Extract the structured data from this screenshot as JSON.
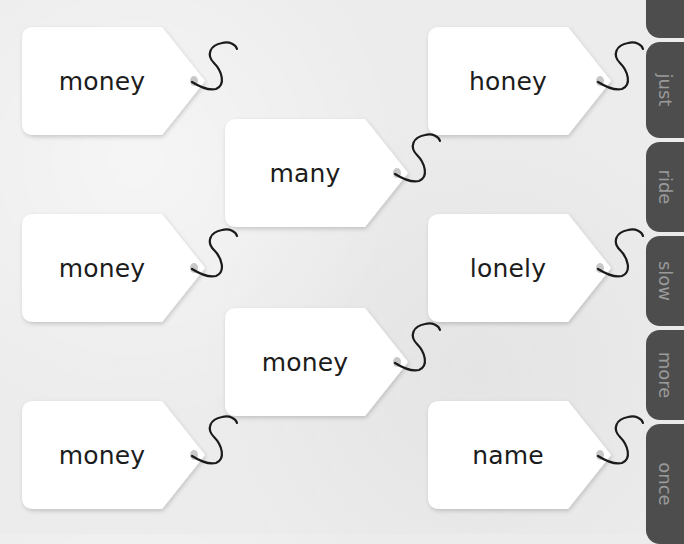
{
  "tags": [
    {
      "word": "money",
      "x": 22,
      "y": 27
    },
    {
      "word": "honey",
      "x": 428,
      "y": 27
    },
    {
      "word": "many",
      "x": 225,
      "y": 119
    },
    {
      "word": "money",
      "x": 22,
      "y": 214
    },
    {
      "word": "lonely",
      "x": 428,
      "y": 214
    },
    {
      "word": "money",
      "x": 225,
      "y": 308
    },
    {
      "word": "money",
      "x": 22,
      "y": 401
    },
    {
      "word": "name",
      "x": 428,
      "y": 401
    }
  ],
  "side_tabs": [
    {
      "label": "o",
      "top": -60,
      "height": 98
    },
    {
      "label": "just",
      "top": 42,
      "height": 96
    },
    {
      "label": "ride",
      "top": 142,
      "height": 90
    },
    {
      "label": "slow",
      "top": 236,
      "height": 90
    },
    {
      "label": "more",
      "top": 330,
      "height": 90
    },
    {
      "label": "once",
      "top": 424,
      "height": 120
    }
  ],
  "colors": {
    "background": "#ececec",
    "tag_fill": "#ffffff",
    "tab_fill": "#4d4d4d",
    "tab_text": "#9a9a9a",
    "word_text": "#1c1c1c",
    "string": "#1a1a1a",
    "hole": "#c8c8c8"
  }
}
